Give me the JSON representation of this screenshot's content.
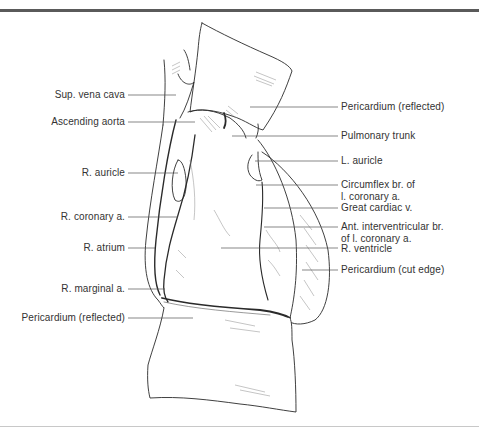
{
  "figure": {
    "colors": {
      "line": "#2a2a2a",
      "leader": "#555555",
      "hatch": "#8a8a8a",
      "text": "#333333",
      "top_rule": "#5a5a5a",
      "bottom_rule": "#c8c8c8"
    }
  },
  "labels_left": [
    {
      "text": "Sup. vena cava"
    },
    {
      "text": "Ascending aorta"
    },
    {
      "text": "R. auricle"
    },
    {
      "text": "R. coronary a."
    },
    {
      "text": "R. atrium"
    },
    {
      "text": "R. marginal a."
    },
    {
      "text": "Pericardium (reflected)"
    }
  ],
  "labels_right": [
    {
      "text": "Pericardium (reflected)"
    },
    {
      "text": "Pulmonary trunk"
    },
    {
      "text": "L. auricle"
    },
    {
      "text": "Circumflex br. of\nl. coronary a."
    },
    {
      "text": "Great cardiac v."
    },
    {
      "text": "Ant. interventricular br.\nof l. coronary a."
    },
    {
      "text": "R. ventricle"
    },
    {
      "text": "Pericardium (cut edge)"
    }
  ]
}
